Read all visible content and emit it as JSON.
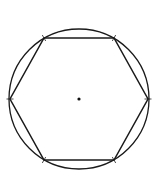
{
  "figure": {
    "stroke_color": "#1a1a1a",
    "background": "#ffffff",
    "circle": {
      "cx": 79,
      "cy": 99,
      "r": 70
    },
    "center_point": {
      "x": 79,
      "y": 99,
      "r": 1.6
    },
    "hexagon_vertices": [
      {
        "x": 44,
        "y": 38
      },
      {
        "x": 114,
        "y": 38
      },
      {
        "x": 148,
        "y": 99
      },
      {
        "x": 114,
        "y": 160
      },
      {
        "x": 44,
        "y": 160
      },
      {
        "x": 10,
        "y": 99
      }
    ],
    "compass_tick_marks": 6
  }
}
